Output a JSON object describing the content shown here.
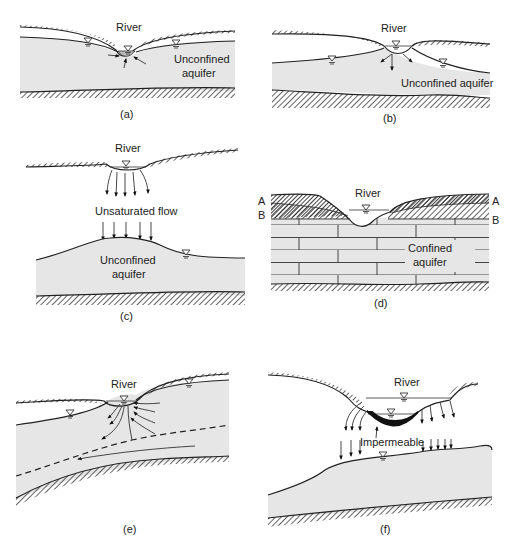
{
  "figure": {
    "panels": [
      {
        "id": "a",
        "caption": "(a)",
        "river_label": "River",
        "aquifer_label_line1": "Unconfined",
        "aquifer_label_line2": "aquifer",
        "description": "Gaining stream: groundwater flows toward the river"
      },
      {
        "id": "b",
        "caption": "(b)",
        "river_label": "River",
        "aquifer_label": "Unconfined aquifer",
        "description": "Losing stream connected to water table"
      },
      {
        "id": "c",
        "caption": "(c)",
        "river_label": "River",
        "flow_label": "Unsaturated flow",
        "aquifer_label_line1": "Unconfined",
        "aquifer_label_line2": "aquifer",
        "description": "Losing stream disconnected from water table"
      },
      {
        "id": "d",
        "caption": "(d)",
        "river_label": "River",
        "layer_labels": [
          "A",
          "B",
          "A",
          "B"
        ],
        "aquifer_label_line1": "Confined",
        "aquifer_label_line2": "aquifer",
        "description": "River over confined aquifer"
      },
      {
        "id": "e",
        "caption": "(e)",
        "river_label": "River",
        "description": "Flow-through stream with dashed flow divide"
      },
      {
        "id": "f",
        "caption": "(f)",
        "river_label": "River",
        "layer_label": "Impermeable",
        "description": "Stream with impermeable clogging layer"
      }
    ],
    "colors": {
      "aquifer_fill": "#e6e6e6",
      "line": "#222222",
      "background": "#ffffff"
    }
  }
}
